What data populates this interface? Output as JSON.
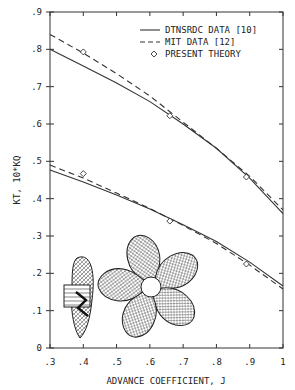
{
  "chart_data": {
    "type": "line",
    "title": "",
    "xlabel": "ADVANCE COEFFICIENT, J",
    "ylabel": "KT, 10*KQ",
    "xlim": [
      0.3,
      1.0
    ],
    "ylim": [
      0,
      0.9
    ],
    "xticks": [
      ".3",
      ".4",
      ".5",
      ".6",
      ".7",
      ".8",
      ".9",
      "1"
    ],
    "yticks": [
      "0",
      ".1",
      ".2",
      ".3",
      ".4",
      ".5",
      ".6",
      ".7",
      ".8",
      ".9"
    ],
    "grid": false,
    "legend_position": "upper right",
    "legend": [
      {
        "label": "DTNSRDC DATA [10]",
        "style": "solid"
      },
      {
        "label": "MIT DATA [12]",
        "style": "dashed"
      },
      {
        "label": "PRESENT THEORY",
        "style": "diamond-marker"
      }
    ],
    "series": [
      {
        "name": "DTNSRDC DATA [10] - KT",
        "style": "solid",
        "x": [
          0.3,
          0.4,
          0.5,
          0.6,
          0.7,
          0.8,
          0.9,
          1.0
        ],
        "y": [
          0.8,
          0.755,
          0.71,
          0.66,
          0.6,
          0.535,
          0.455,
          0.36
        ]
      },
      {
        "name": "MIT DATA [12] - KT",
        "style": "dashed",
        "x": [
          0.3,
          0.4,
          0.5,
          0.6,
          0.7,
          0.8,
          0.9,
          1.0
        ],
        "y": [
          0.84,
          0.79,
          0.735,
          0.675,
          0.605,
          0.535,
          0.46,
          0.37
        ]
      },
      {
        "name": "PRESENT THEORY - KT",
        "style": "marker",
        "x": [
          0.4,
          0.66,
          0.89
        ],
        "y": [
          0.793,
          0.622,
          0.458
        ]
      },
      {
        "name": "DTNSRDC DATA [10] - 10KQ",
        "style": "solid",
        "x": [
          0.3,
          0.4,
          0.5,
          0.6,
          0.7,
          0.8,
          0.9,
          1.0
        ],
        "y": [
          0.477,
          0.445,
          0.41,
          0.372,
          0.33,
          0.285,
          0.23,
          0.166
        ]
      },
      {
        "name": "MIT DATA [12] - 10KQ",
        "style": "dashed",
        "x": [
          0.3,
          0.4,
          0.5,
          0.6,
          0.7,
          0.8,
          0.9,
          1.0
        ],
        "y": [
          0.49,
          0.455,
          0.415,
          0.374,
          0.328,
          0.28,
          0.222,
          0.158
        ]
      },
      {
        "name": "PRESENT THEORY - 10KQ",
        "style": "marker",
        "x": [
          0.4,
          0.66,
          0.89
        ],
        "y": [
          0.467,
          0.34,
          0.225
        ]
      }
    ],
    "annotations": [
      "propeller side view wireframe",
      "propeller front view wireframe (5 blades)"
    ]
  }
}
